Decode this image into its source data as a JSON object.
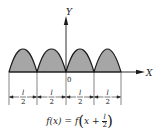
{
  "diagram": {
    "axes": {
      "x_label": "X",
      "y_label": "Y",
      "origin_label": "0"
    },
    "arches": {
      "count": 4,
      "boundaries_px": [
        9,
        37,
        66,
        94,
        121
      ],
      "baseline_px": 72,
      "peak_px": 49,
      "fill": "#a8a8a8",
      "hatch": "#8a8a8a",
      "stroke": "#1a1a1a"
    },
    "dimensions": [
      {
        "numerator": "l",
        "denominator": "2"
      },
      {
        "numerator": "l",
        "denominator": "2"
      },
      {
        "numerator": "l",
        "denominator": "2"
      },
      {
        "numerator": "l",
        "denominator": "2"
      }
    ],
    "formula": {
      "lhs": "f(x)",
      "eq": "=",
      "rhs_func": "f",
      "rhs_var": "x",
      "rhs_plus": "+",
      "frac_num": "l",
      "frac_den": "2"
    }
  }
}
